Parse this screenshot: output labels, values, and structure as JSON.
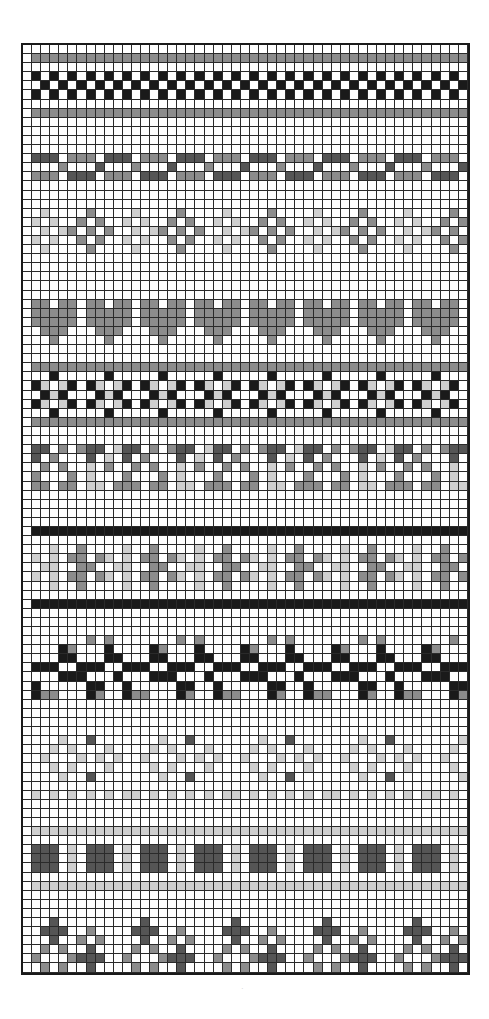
{
  "chart_data": {
    "type": "heatmap",
    "title": "",
    "columns": 49,
    "rows": 102,
    "legend": {
      ".": "#ffffff",
      "L": "#cfcfcf",
      "G": "#8c8c8c",
      "D": "#555555",
      "B": "#1a1a1a"
    },
    "first_column_white": true,
    "bands": [
      {
        "name": "blank",
        "rows": [
          "."
        ]
      },
      {
        "name": "gray-line-top",
        "rows": [
          "G"
        ]
      },
      {
        "name": "blank",
        "rows": [
          "."
        ]
      },
      {
        "name": "x-pattern",
        "rows": [
          "B.B.",
          ".B.B",
          "B.B."
        ],
        "period_note": "checker-like X motif, black"
      },
      {
        "name": "blank",
        "rows": [
          "."
        ]
      },
      {
        "name": "gray-line",
        "rows": [
          "G"
        ]
      },
      {
        "name": "blank",
        "rows": [
          ".",
          ".",
          ".",
          "."
        ]
      },
      {
        "name": "dash-pattern",
        "rows": [
          "DDD.GGG.",
          "...G...D",
          "GGG.DDD."
        ]
      },
      {
        "name": "blank",
        "rows": [
          ".",
          ".",
          "."
        ]
      },
      {
        "name": "diamonds",
        "rows": [
          ".L....G...",
          "L.L..G.G..",
          ".L.LG.G.G.",
          "L.L..G.G..",
          ".L....G..."
        ]
      },
      {
        "name": "blank",
        "rows": [
          ".",
          ".",
          ".",
          ".",
          "."
        ]
      },
      {
        "name": "hearts",
        "rows": [
          "GG.GG.",
          "GGGGG.",
          "GGGGG.",
          ".GGG..",
          "..G..."
        ]
      },
      {
        "name": "blank",
        "rows": [
          ".",
          "."
        ]
      },
      {
        "name": "gray-line",
        "rows": [
          "G"
        ]
      },
      {
        "name": "checker",
        "rows": [
          "..B...",
          "BL.LB.",
          ".BLB..",
          "BL.LB.",
          "..B..."
        ]
      },
      {
        "name": "gray-line",
        "rows": [
          "G"
        ]
      },
      {
        "name": "blank",
        "rows": [
          ".",
          "."
        ]
      },
      {
        "name": "triangles",
        "rows": [
          "DD.G.GDD.L",
          "D.G...D.L.",
          ".G.G..L.G.",
          "G...G.L...",
          "GG.GG.LL.G"
        ]
      },
      {
        "name": "blank",
        "rows": [
          ".",
          ".",
          ".",
          "."
        ]
      },
      {
        "name": "black-line",
        "rows": [
          "B"
        ]
      },
      {
        "name": "blank",
        "rows": [
          "."
        ]
      },
      {
        "name": "light-gray-band",
        "rows": [
          "..L..G..",
          "L.L.GG.G",
          ".LL..GG.",
          "L.L.GG.G",
          "..L..G.."
        ]
      },
      {
        "name": "blank",
        "rows": [
          "."
        ]
      },
      {
        "name": "black-line",
        "rows": [
          "B"
        ]
      },
      {
        "name": "blank",
        "rows": [
          ".",
          ".",
          "."
        ]
      },
      {
        "name": "vine",
        "rows": [
          "......G.G.",
          "...BG...B.",
          "...BB...BB",
          "BBB..BBB..",
          "...BBB...B",
          "B.....BB..",
          "BGG...BG.."
        ]
      },
      {
        "name": "blank",
        "rows": [
          ".",
          ".",
          ".",
          "."
        ]
      },
      {
        "name": "dotted",
        "rows": [
          "...L..D....",
          "..L.L...L..",
          ".L...L.L.L.",
          "..L.L...L..",
          "...L..D....",
          "...........",
          "L.L.L.L.L.L",
          "..........."
        ]
      },
      {
        "name": "blank",
        "rows": [
          ".",
          "."
        ]
      },
      {
        "name": "light-line",
        "rows": [
          "L"
        ]
      },
      {
        "name": "blank",
        "rows": [
          "."
        ]
      },
      {
        "name": "squares",
        "rows": [
          "DDD.L.",
          "DDD.L.",
          "DDD.L."
        ]
      },
      {
        "name": "blank",
        "rows": [
          "."
        ]
      },
      {
        "name": "light-line",
        "rows": [
          "L"
        ]
      },
      {
        "name": "blank",
        "rows": [
          ".",
          ".",
          "."
        ]
      },
      {
        "name": "cross-band",
        "rows": [
          "..D.......",
          ".DDD..G...",
          "..D..G.G..",
          ".G.G..D...",
          "G...GDDD..",
          ".G.G..D..."
        ]
      }
    ]
  },
  "footer": {
    "speck": "·"
  }
}
